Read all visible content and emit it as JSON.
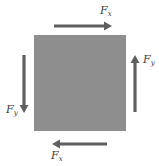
{
  "diagram": {
    "element": {
      "shape": "square",
      "fill": "#8e8e8e"
    },
    "arrow_color": "#5f5f5f",
    "label_color": "#3a3a3a",
    "forces": [
      {
        "id": "top",
        "side": "top",
        "direction": "right",
        "symbol": "F",
        "subscript": "x"
      },
      {
        "id": "right",
        "side": "right",
        "direction": "up",
        "symbol": "F",
        "subscript": "y"
      },
      {
        "id": "left",
        "side": "left",
        "direction": "down",
        "symbol": "F",
        "subscript": "y"
      },
      {
        "id": "bottom",
        "side": "bottom",
        "direction": "left",
        "symbol": "F",
        "subscript": "x"
      }
    ]
  }
}
